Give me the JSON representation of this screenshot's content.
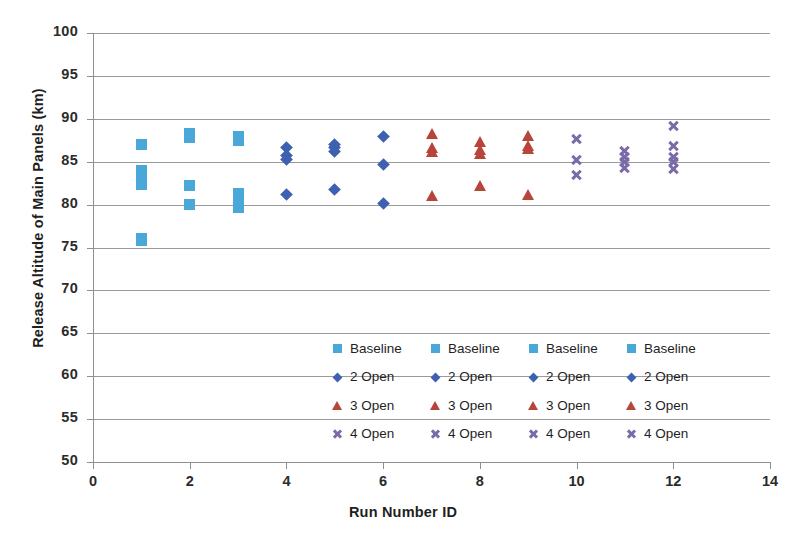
{
  "chart_data": {
    "type": "scatter",
    "title": "",
    "xlabel": "Run Number ID",
    "ylabel": "Release Altitude of Main Panels (km)",
    "xlim": [
      0,
      14
    ],
    "ylim": [
      50,
      100
    ],
    "xticks": [
      0,
      2,
      4,
      6,
      8,
      10,
      12,
      14
    ],
    "yticks": [
      50,
      55,
      60,
      65,
      70,
      75,
      80,
      85,
      90,
      95,
      100
    ],
    "grid": "horizontal",
    "legend_position": "inside-center",
    "series": [
      {
        "name": "Baseline",
        "marker": "square",
        "color": "#4aa8d8",
        "points": [
          {
            "x": 1,
            "y": 87.0
          },
          {
            "x": 1,
            "y": 84.0
          },
          {
            "x": 1,
            "y": 83.2
          },
          {
            "x": 1,
            "y": 82.4
          },
          {
            "x": 1,
            "y": 76.1
          },
          {
            "x": 1,
            "y": 75.8
          },
          {
            "x": 2,
            "y": 88.3
          },
          {
            "x": 2,
            "y": 87.8
          },
          {
            "x": 2,
            "y": 82.2
          },
          {
            "x": 2,
            "y": 80.0
          },
          {
            "x": 3,
            "y": 87.9
          },
          {
            "x": 3,
            "y": 87.5
          },
          {
            "x": 3,
            "y": 81.3
          },
          {
            "x": 3,
            "y": 80.1
          },
          {
            "x": 3,
            "y": 79.7
          }
        ]
      },
      {
        "name": "2 Open",
        "marker": "diamond",
        "color": "#3d61b0",
        "points": [
          {
            "x": 4,
            "y": 86.7
          },
          {
            "x": 4,
            "y": 85.7
          },
          {
            "x": 4,
            "y": 85.3
          },
          {
            "x": 4,
            "y": 81.2
          },
          {
            "x": 5,
            "y": 87.0
          },
          {
            "x": 5,
            "y": 86.6
          },
          {
            "x": 5,
            "y": 86.2
          },
          {
            "x": 5,
            "y": 81.8
          },
          {
            "x": 6,
            "y": 87.9
          },
          {
            "x": 6,
            "y": 84.7
          },
          {
            "x": 6,
            "y": 80.1
          }
        ]
      },
      {
        "name": "3 Open",
        "marker": "triangle",
        "color": "#b8453a",
        "points": [
          {
            "x": 7,
            "y": 88.3
          },
          {
            "x": 7,
            "y": 86.6
          },
          {
            "x": 7,
            "y": 86.2
          },
          {
            "x": 7,
            "y": 81.1
          },
          {
            "x": 8,
            "y": 87.3
          },
          {
            "x": 8,
            "y": 86.4
          },
          {
            "x": 8,
            "y": 86.0
          },
          {
            "x": 8,
            "y": 82.2
          },
          {
            "x": 9,
            "y": 88.0
          },
          {
            "x": 9,
            "y": 86.9
          },
          {
            "x": 9,
            "y": 86.5
          },
          {
            "x": 9,
            "y": 81.2
          }
        ]
      },
      {
        "name": "4 Open",
        "marker": "cross",
        "color": "#7a6ba8",
        "points": [
          {
            "x": 10,
            "y": 87.6
          },
          {
            "x": 10,
            "y": 85.2
          },
          {
            "x": 10,
            "y": 83.4
          },
          {
            "x": 11,
            "y": 86.2
          },
          {
            "x": 11,
            "y": 85.6
          },
          {
            "x": 11,
            "y": 85.0
          },
          {
            "x": 11,
            "y": 84.3
          },
          {
            "x": 12,
            "y": 89.2
          },
          {
            "x": 12,
            "y": 86.8
          },
          {
            "x": 12,
            "y": 85.6
          },
          {
            "x": 12,
            "y": 85.0
          },
          {
            "x": 12,
            "y": 84.2
          }
        ]
      }
    ],
    "legend_columns": [
      {
        "entries": [
          {
            "label": "Baseline",
            "marker": "square"
          },
          {
            "label": "2 Open",
            "marker": "diamond"
          },
          {
            "label": "3 Open",
            "marker": "triangle"
          },
          {
            "label": "4 Open",
            "marker": "cross"
          }
        ]
      },
      {
        "entries": [
          {
            "label": "Baseline",
            "marker": "square"
          },
          {
            "label": "2 Open",
            "marker": "diamond"
          },
          {
            "label": "3 Open",
            "marker": "triangle"
          },
          {
            "label": "4 Open",
            "marker": "cross"
          }
        ]
      },
      {
        "entries": [
          {
            "label": "Baseline",
            "marker": "square"
          },
          {
            "label": "2 Open",
            "marker": "diamond"
          },
          {
            "label": "3 Open",
            "marker": "triangle"
          },
          {
            "label": "4 Open",
            "marker": "cross"
          }
        ]
      },
      {
        "entries": [
          {
            "label": "Baseline",
            "marker": "square"
          },
          {
            "label": "2 Open",
            "marker": "diamond"
          },
          {
            "label": "3 Open",
            "marker": "triangle"
          },
          {
            "label": "4 Open",
            "marker": "cross"
          }
        ]
      }
    ]
  },
  "colors": {
    "baseline": "#4aa8d8",
    "two_open": "#3d61b0",
    "three_open": "#b8453a",
    "four_open": "#7a6ba8",
    "gridline": "#9a9a9a",
    "axis": "#8f8f8f",
    "text": "#1f1f1f"
  }
}
